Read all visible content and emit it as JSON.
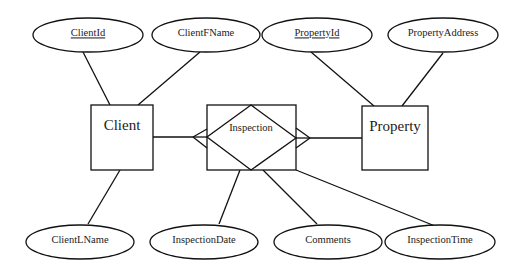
{
  "diagram": {
    "type": "entity-relationship",
    "entities": [
      {
        "id": "client",
        "label": "Client"
      },
      {
        "id": "property",
        "label": "Property"
      }
    ],
    "associative_entity": {
      "id": "inspection",
      "label": "Inspection"
    },
    "attributes": [
      {
        "id": "clientid",
        "label": "ClientId",
        "owner": "Client",
        "is_key": true
      },
      {
        "id": "clientfname",
        "label": "ClientFName",
        "owner": "Client",
        "is_key": false
      },
      {
        "id": "clientlname",
        "label": "ClientLName",
        "owner": "Client",
        "is_key": false
      },
      {
        "id": "propertyid",
        "label": "PropertyId",
        "owner": "Property",
        "is_key": true
      },
      {
        "id": "propertyaddress",
        "label": "PropertyAddress",
        "owner": "Property",
        "is_key": false
      },
      {
        "id": "inspectiondate",
        "label": "InspectionDate",
        "owner": "Inspection",
        "is_key": false
      },
      {
        "id": "comments",
        "label": "Comments",
        "owner": "Inspection",
        "is_key": false
      },
      {
        "id": "inspectiontime",
        "label": "InspectionTime",
        "owner": "Inspection",
        "is_key": false
      }
    ],
    "relationships": [
      {
        "from": "Client",
        "to": "Inspection",
        "cardinality": "one-to-many"
      },
      {
        "from": "Property",
        "to": "Inspection",
        "cardinality": "one-to-many"
      }
    ]
  },
  "labels": {
    "client": "Client",
    "property": "Property",
    "inspection": "Inspection",
    "clientid": "ClientId",
    "clientfname": "ClientFName",
    "clientlname": "ClientLName",
    "propertyid": "PropertyId",
    "propertyaddress": "PropertyAddress",
    "inspectiondate": "InspectionDate",
    "comments": "Comments",
    "inspectiontime": "InspectionTime"
  }
}
